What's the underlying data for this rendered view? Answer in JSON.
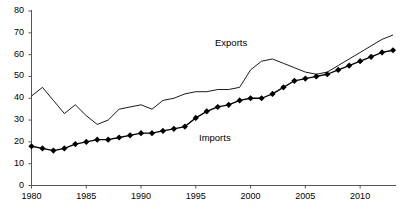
{
  "chart_data": {
    "type": "line",
    "title": "",
    "xlabel": "",
    "ylabel": "",
    "xlim": [
      1980,
      2013
    ],
    "ylim": [
      0,
      80
    ],
    "grid": false,
    "legend_position": "inline-annotation",
    "yticks": [
      0,
      10,
      20,
      30,
      40,
      50,
      60,
      70,
      80
    ],
    "ytick_labels": [
      "0",
      "10",
      "20",
      "30",
      "40",
      "50",
      "60",
      "70",
      "80"
    ],
    "xticks": [
      1980,
      1985,
      1990,
      1995,
      2000,
      2005,
      2010
    ],
    "xtick_labels": [
      "1980",
      "1985",
      "1990",
      "1995",
      "2000",
      "2005",
      "2010"
    ],
    "x": [
      1980,
      1981,
      1982,
      1983,
      1984,
      1985,
      1986,
      1987,
      1988,
      1989,
      1990,
      1991,
      1992,
      1993,
      1994,
      1995,
      1996,
      1997,
      1998,
      1999,
      2000,
      2001,
      2002,
      2003,
      2004,
      2005,
      2006,
      2007,
      2008,
      2009,
      2010,
      2011,
      2012,
      2013
    ],
    "series": [
      {
        "name": "Exports",
        "marker": "none",
        "line_style": "solid",
        "color": "#000000",
        "values": [
          41,
          45,
          39,
          33,
          37,
          32,
          28,
          30,
          35,
          36,
          37,
          35,
          39,
          40,
          42,
          43,
          43,
          44,
          44,
          45,
          53,
          57,
          58,
          56,
          54,
          52,
          51,
          52,
          55,
          58,
          61,
          64,
          67,
          69
        ]
      },
      {
        "name": "Imports",
        "marker": "diamond",
        "line_style": "solid",
        "color": "#000000",
        "values": [
          18,
          17,
          16,
          17,
          19,
          20,
          21,
          21,
          22,
          23,
          24,
          24,
          25,
          26,
          27,
          31,
          34,
          36,
          37,
          39,
          40,
          40,
          42,
          45,
          48,
          49,
          50,
          51,
          53,
          55,
          57,
          59,
          61,
          62
        ]
      }
    ],
    "annotations": [
      {
        "text": "Exports",
        "x": 1997,
        "y": 64
      },
      {
        "text": "Imports",
        "x": 1996,
        "y": 27
      }
    ]
  },
  "axis": {
    "y_labels": [
      "80",
      "70",
      "60",
      "50",
      "40",
      "30",
      "20",
      "10",
      "0"
    ],
    "x_labels": [
      "1980",
      "1985",
      "1990",
      "1995",
      "2000",
      "2005",
      "2010"
    ]
  },
  "labels": {
    "exports": "Exports",
    "imports": "Imports"
  }
}
